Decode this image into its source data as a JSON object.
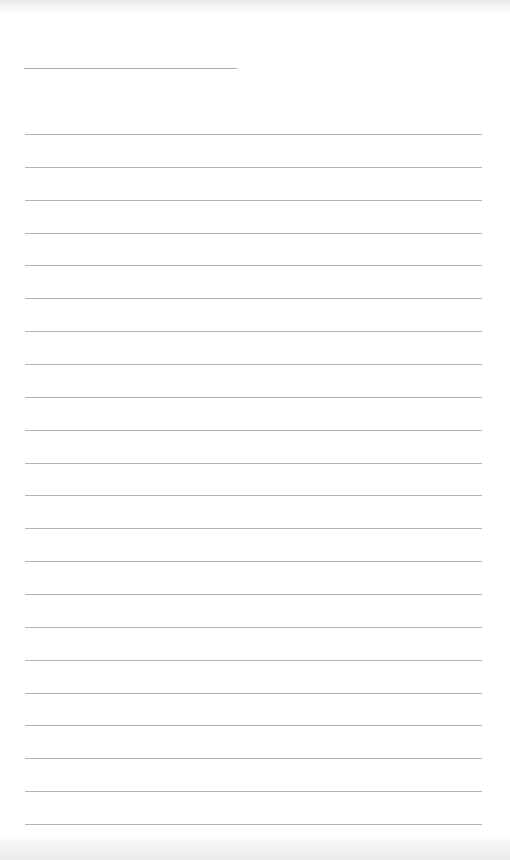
{
  "page": {
    "type": "lined-notepad-sheet",
    "background_color": "#ffffff",
    "line_color": "#b4b4b4",
    "title_line": {
      "x": 24,
      "y": 68,
      "width": 213
    },
    "ruled_lines": {
      "count": 22,
      "x": 25,
      "width": 457,
      "first_y": 134,
      "spacing": 32.86
    },
    "text": []
  }
}
